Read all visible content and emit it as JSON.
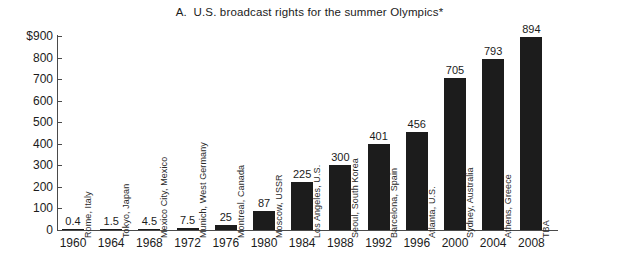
{
  "chart_data": {
    "type": "bar",
    "title": "A.  U.S. broadcast rights for the summer Olympics*",
    "xlabel": "",
    "ylabel": "",
    "ylim": [
      0,
      900
    ],
    "ytick_labels": [
      "$900",
      "800",
      "700",
      "600",
      "500",
      "400",
      "300",
      "200",
      "100",
      "0"
    ],
    "ytick_values": [
      900,
      800,
      700,
      600,
      500,
      400,
      300,
      200,
      100,
      0
    ],
    "grid": false,
    "legend": "none",
    "categories": [
      "1960",
      "1964",
      "1968",
      "1972",
      "1976",
      "1980",
      "1984",
      "1988",
      "1992",
      "1996",
      "2000",
      "2004",
      "2008"
    ],
    "values": [
      0.4,
      1.5,
      4.5,
      7.5,
      25,
      87,
      225,
      300,
      401,
      456,
      705,
      793,
      894
    ],
    "value_labels": [
      "0.4",
      "1.5",
      "4.5",
      "7.5",
      "25",
      "87",
      "225",
      "300",
      "401",
      "456",
      "705",
      "793",
      "894"
    ],
    "point_annotations": [
      "Rome, Italy",
      "Tokyo, Japan",
      "Mexico City, Mexico",
      "Munich, West Germany",
      "Montreal, Canada",
      "Moscow, USSR",
      "Los Angeles, U.S.",
      "Seoul, South Korea",
      "Barcelona, Spain",
      "Atlanta, U.S.",
      "Sydney, Australia",
      "Athens, Greece",
      "TBA"
    ],
    "bar_color": "#1c1c1c",
    "axis_color": "#4a4a4a",
    "background": "#ffffff"
  }
}
